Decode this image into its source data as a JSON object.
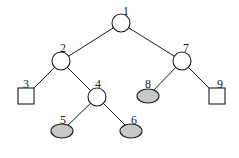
{
  "diagram": {
    "type": "binary-tree",
    "nodes": [
      {
        "id": "1",
        "label": "1",
        "shape": "circle",
        "fill": "white",
        "cx": 121,
        "cy": 23,
        "label_x": 126,
        "label_y": 12
      },
      {
        "id": "2",
        "label": "2",
        "shape": "circle",
        "fill": "white",
        "cx": 61,
        "cy": 61,
        "label_x": 63,
        "label_y": 49
      },
      {
        "id": "3",
        "label": "3",
        "shape": "square",
        "fill": "white",
        "cx": 26,
        "cy": 96,
        "label_x": 26,
        "label_y": 85
      },
      {
        "id": "4",
        "label": "4",
        "shape": "circle",
        "fill": "white",
        "cx": 97,
        "cy": 97,
        "label_x": 98,
        "label_y": 85
      },
      {
        "id": "5",
        "label": "5",
        "shape": "ellipse",
        "fill": "gray",
        "cx": 62,
        "cy": 131,
        "label_x": 63,
        "label_y": 121
      },
      {
        "id": "6",
        "label": "6",
        "shape": "ellipse",
        "fill": "gray",
        "cx": 131,
        "cy": 131,
        "label_x": 134,
        "label_y": 121
      },
      {
        "id": "7",
        "label": "7",
        "shape": "circle",
        "fill": "white",
        "cx": 182,
        "cy": 61,
        "label_x": 186,
        "label_y": 49
      },
      {
        "id": "8",
        "label": "8",
        "shape": "ellipse",
        "fill": "gray",
        "cx": 148,
        "cy": 96,
        "label_x": 148,
        "label_y": 85
      },
      {
        "id": "9",
        "label": "9",
        "shape": "square",
        "fill": "white",
        "cx": 217,
        "cy": 96,
        "label_x": 220,
        "label_y": 85
      }
    ],
    "edges": [
      {
        "from": "1",
        "to": "2"
      },
      {
        "from": "1",
        "to": "7"
      },
      {
        "from": "2",
        "to": "3"
      },
      {
        "from": "2",
        "to": "4"
      },
      {
        "from": "4",
        "to": "5"
      },
      {
        "from": "4",
        "to": "6"
      },
      {
        "from": "7",
        "to": "8"
      },
      {
        "from": "7",
        "to": "9"
      }
    ],
    "colors": {
      "stroke": "#1a1a1a",
      "leaf_fill": "#c8c8c8",
      "node_fill": "#ffffff"
    },
    "sizes": {
      "circle_r": 9,
      "square_size": 16,
      "ellipse_rx": 11,
      "ellipse_ry": 7
    }
  }
}
